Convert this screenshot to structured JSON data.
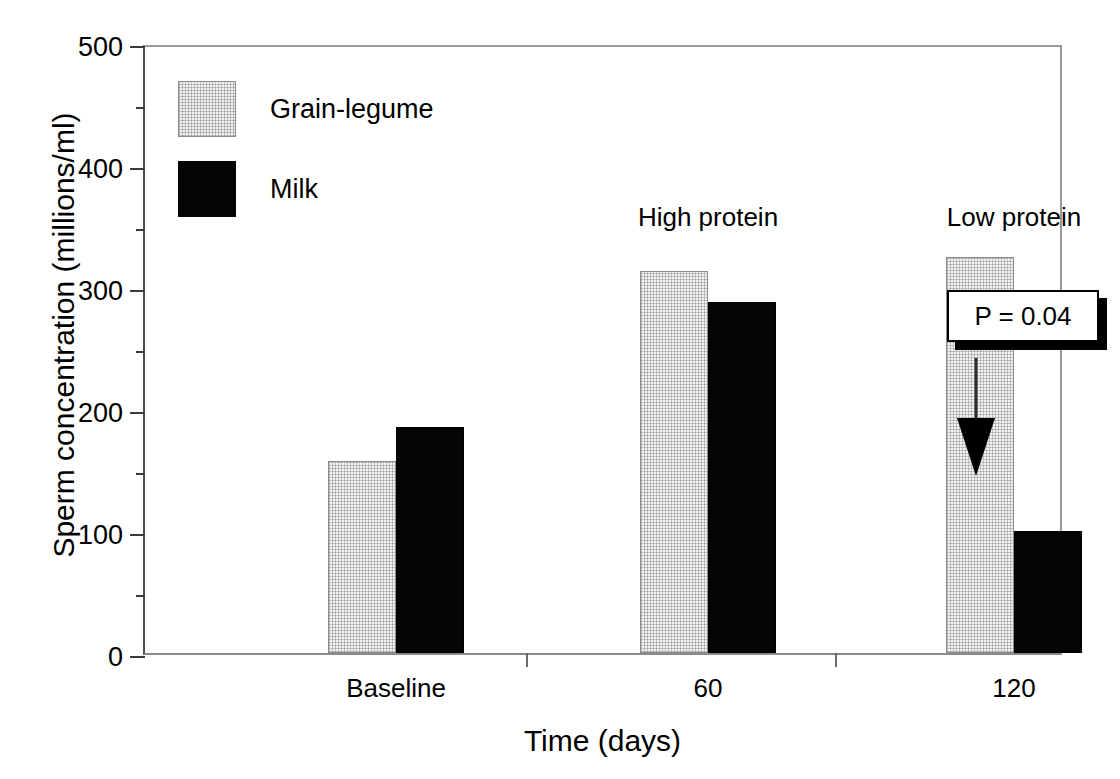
{
  "chart_data": {
    "type": "bar",
    "title": "",
    "xlabel": "Time (days)",
    "ylabel": "Sperm concentration (millions/ml)",
    "categories": [
      "Baseline",
      "60",
      "120"
    ],
    "ylim": [
      0,
      500
    ],
    "ytick_labels": [
      "0",
      "100",
      "200",
      "300",
      "400",
      "500"
    ],
    "ytick_values": [
      0,
      100,
      200,
      300,
      400,
      500
    ],
    "yminor_values": [
      50,
      150,
      250,
      350,
      450
    ],
    "grid": false,
    "legend_position": "upper-left-inside",
    "series": [
      {
        "name": "Grain-legume",
        "color": "#f2f2f2",
        "pattern": "stipple",
        "values": [
          157,
          313,
          325
        ]
      },
      {
        "name": "Milk",
        "color": "#050505",
        "pattern": "solid",
        "values": [
          185,
          288,
          100
        ]
      }
    ],
    "annotations": [
      {
        "name": "high-protein-note",
        "text": "High protein",
        "x_category": "60",
        "y": 360
      },
      {
        "name": "low-protein-note",
        "text": "Low protein",
        "x_category": "120",
        "y": 360
      },
      {
        "name": "p-value-callout",
        "text": "P = 0.04",
        "x_category": "120",
        "y": 330
      },
      {
        "name": "decrease-arrow",
        "text": "",
        "x_category": "120",
        "y": 230
      }
    ]
  },
  "legend": {
    "items": [
      {
        "label": "Grain-legume",
        "swatch": "grain"
      },
      {
        "label": "Milk",
        "swatch": "milk"
      }
    ]
  },
  "axes": {
    "y_title": "Sperm concentration (millions/ml)",
    "x_title": "Time (days)",
    "y_ticks": [
      "500",
      "400",
      "300",
      "200",
      "100",
      "0"
    ],
    "x_ticks": [
      "Baseline",
      "60",
      "120"
    ]
  },
  "callout": {
    "p_value_text": "P = 0.04"
  },
  "notes": {
    "high_protein": "High protein",
    "low_protein": "Low protein"
  }
}
